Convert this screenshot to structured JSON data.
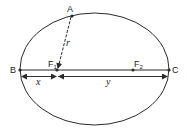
{
  "diagram": {
    "type": "ellipse-with-foci",
    "points": {
      "A": "A",
      "B": "B",
      "C": "C",
      "F1": {
        "base": "F",
        "sub": "1"
      },
      "F2": {
        "base": "F",
        "sub": "2"
      }
    },
    "distances": {
      "r": "r",
      "x": "x",
      "y": "y"
    },
    "colors": {
      "line": "#2a2a2a",
      "background": "#ffffff"
    }
  }
}
